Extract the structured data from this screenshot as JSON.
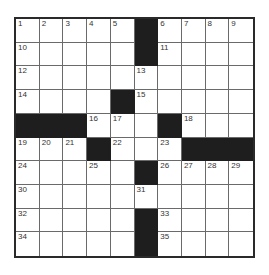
{
  "puzzle": {
    "rows": 10,
    "cols": 10,
    "colors": {
      "block": "#1e1e1e",
      "cell": "#ffffff",
      "border": "#2a2a2a"
    },
    "layout": [
      "....#....",
      "....#....",
      ".........",
      "....#....",
      "###..#...",
      "...#...###",
      "....#.....",
      "..........",
      "....#.....",
      "....#....."
    ],
    "grid": [
      [
        {
          "n": "1"
        },
        {
          "n": "2"
        },
        {
          "n": "3"
        },
        {
          "n": "4"
        },
        {
          "n": "5"
        },
        {
          "b": 1
        },
        {
          "n": "6"
        },
        {
          "n": "7"
        },
        {
          "n": "8"
        },
        {
          "n": "9"
        }
      ],
      [
        {
          "n": "10"
        },
        {},
        {},
        {},
        {},
        {
          "b": 1
        },
        {
          "n": "11"
        },
        {},
        {},
        {}
      ],
      [
        {
          "n": "12"
        },
        {},
        {},
        {},
        {},
        {
          "n": "13"
        },
        {},
        {},
        {},
        {}
      ],
      [
        {
          "n": "14"
        },
        {},
        {},
        {},
        {
          "b": 1
        },
        {
          "n": "15"
        },
        {},
        {},
        {},
        {}
      ],
      [
        {
          "b": 1
        },
        {
          "b": 1
        },
        {
          "b": 1
        },
        {
          "n": "16"
        },
        {
          "n": "17"
        },
        {},
        {
          "b": 1
        },
        {
          "n": "18"
        },
        {},
        {}
      ],
      [
        {
          "n": "19"
        },
        {
          "n": "20"
        },
        {
          "n": "21"
        },
        {
          "b": 1
        },
        {
          "n": "22"
        },
        {},
        {
          "n": "23"
        },
        {
          "b": 1
        },
        {
          "b": 1
        },
        {
          "b": 1
        }
      ],
      [
        {
          "n": "24"
        },
        {},
        {},
        {
          "n": "25"
        },
        {},
        {
          "b": 1
        },
        {
          "n": "26"
        },
        {
          "n": "27"
        },
        {
          "n": "28"
        },
        {
          "n": "29"
        }
      ],
      [
        {
          "n": "30"
        },
        {},
        {},
        {},
        {},
        {
          "n": "31"
        },
        {},
        {},
        {},
        {}
      ],
      [
        {
          "n": "32"
        },
        {},
        {},
        {},
        {},
        {
          "b": 1
        },
        {
          "n": "33"
        },
        {},
        {},
        {}
      ],
      [
        {
          "n": "34"
        },
        {},
        {},
        {},
        {},
        {
          "b": 1
        },
        {
          "n": "35"
        },
        {},
        {},
        {}
      ]
    ]
  }
}
